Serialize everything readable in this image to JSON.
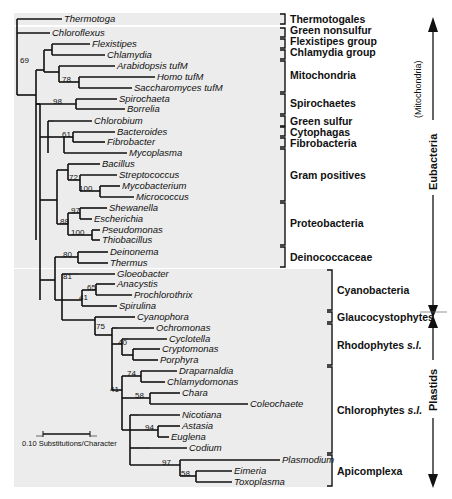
{
  "figure": {
    "type": "phylogenetic-tree",
    "scale_bar_label": "0.10 Substitutions/Character",
    "caption_partial": "",
    "taxa": [
      {
        "name": "Thermotoga",
        "y": 19,
        "x_end": 62
      },
      {
        "name": "Chloroflexus",
        "y": 33,
        "x_end": 50
      },
      {
        "name": "Flexistipes",
        "y": 44,
        "x_end": 90
      },
      {
        "name": "Chlamydia",
        "y": 55,
        "x_end": 105
      },
      {
        "name": "Arabidopsis tufM",
        "y": 66,
        "x_end": 115
      },
      {
        "name": "Homo tufM",
        "y": 77,
        "x_end": 155
      },
      {
        "name": "Saccharomyces tufM",
        "y": 88,
        "x_end": 132
      },
      {
        "name": "Spirochaeta",
        "y": 99,
        "x_end": 117
      },
      {
        "name": "Borrelia",
        "y": 109,
        "x_end": 125
      },
      {
        "name": "Chlorobium",
        "y": 121,
        "x_end": 92
      },
      {
        "name": "Bacteroides",
        "y": 132,
        "x_end": 115
      },
      {
        "name": "Fibrobacter",
        "y": 142,
        "x_end": 105
      },
      {
        "name": "Mycoplasma",
        "y": 153,
        "x_end": 127
      },
      {
        "name": "Bacillus",
        "y": 164,
        "x_end": 100
      },
      {
        "name": "Streptococcus",
        "y": 175,
        "x_end": 117
      },
      {
        "name": "Mycobacterium",
        "y": 186,
        "x_end": 120
      },
      {
        "name": "Micrococcus",
        "y": 197,
        "x_end": 134
      },
      {
        "name": "Shewanella",
        "y": 208,
        "x_end": 107
      },
      {
        "name": "Escherichia",
        "y": 219,
        "x_end": 92
      },
      {
        "name": "Pseudomonas",
        "y": 230,
        "x_end": 100
      },
      {
        "name": "Thiobacillus",
        "y": 240,
        "x_end": 100
      },
      {
        "name": "Deinonema",
        "y": 252,
        "x_end": 108
      },
      {
        "name": "Thermus",
        "y": 263,
        "x_end": 108
      },
      {
        "name": "Gloeobacter",
        "y": 274,
        "x_end": 115
      },
      {
        "name": "Anacystis",
        "y": 284,
        "x_end": 115
      },
      {
        "name": "Prochlorothrix",
        "y": 295,
        "x_end": 132
      },
      {
        "name": "Spirulina",
        "y": 306,
        "x_end": 117
      },
      {
        "name": "Cyanophora",
        "y": 317,
        "x_end": 135
      },
      {
        "name": "Ochromonas",
        "y": 328,
        "x_end": 154
      },
      {
        "name": "Cyclotella",
        "y": 339,
        "x_end": 167
      },
      {
        "name": "Cryptomonas",
        "y": 349,
        "x_end": 160
      },
      {
        "name": "Porphyra",
        "y": 360,
        "x_end": 158
      },
      {
        "name": "Draparnaldia",
        "y": 371,
        "x_end": 177
      },
      {
        "name": "Chlamydomonas",
        "y": 382,
        "x_end": 165
      },
      {
        "name": "Chara",
        "y": 393,
        "x_end": 180
      },
      {
        "name": "Coleochaete",
        "y": 404,
        "x_end": 248
      },
      {
        "name": "Nicotiana",
        "y": 415,
        "x_end": 180
      },
      {
        "name": "Astasia",
        "y": 426,
        "x_end": 180
      },
      {
        "name": "Euglena",
        "y": 437,
        "x_end": 169
      },
      {
        "name": "Codium",
        "y": 448,
        "x_end": 187
      },
      {
        "name": "Plasmodium",
        "y": 460,
        "x_end": 280
      },
      {
        "name": "Eimeria",
        "y": 471,
        "x_end": 232
      },
      {
        "name": "Toxoplasma",
        "y": 482,
        "x_end": 232
      }
    ],
    "bootstrap": [
      {
        "value": "69",
        "x": 20,
        "y": 63
      },
      {
        "value": "78",
        "x": 62,
        "y": 82
      },
      {
        "value": "98",
        "x": 53,
        "y": 104
      },
      {
        "value": "61",
        "x": 62,
        "y": 137
      },
      {
        "value": "72",
        "x": 69,
        "y": 180
      },
      {
        "value": "100",
        "x": 79,
        "y": 191
      },
      {
        "value": "97",
        "x": 71,
        "y": 213
      },
      {
        "value": "88",
        "x": 60,
        "y": 224
      },
      {
        "value": "100",
        "x": 71,
        "y": 235
      },
      {
        "value": "80",
        "x": 63,
        "y": 257
      },
      {
        "value": "81",
        "x": 63,
        "y": 279
      },
      {
        "value": "65",
        "x": 87,
        "y": 290
      },
      {
        "value": "41",
        "x": 79,
        "y": 300
      },
      {
        "value": "75",
        "x": 96,
        "y": 329
      },
      {
        "value": "40",
        "x": 118,
        "y": 345
      },
      {
        "value": "74",
        "x": 127,
        "y": 376
      },
      {
        "value": "41",
        "x": 110,
        "y": 392
      },
      {
        "value": "58",
        "x": 135,
        "y": 398
      },
      {
        "value": "94",
        "x": 145,
        "y": 430
      },
      {
        "value": "97",
        "x": 162,
        "y": 465
      },
      {
        "value": "58",
        "x": 181,
        "y": 476
      }
    ],
    "groups": [
      {
        "name": "Thermotogales",
        "y_top": 14,
        "y_bot": 24,
        "label_y": 23,
        "italic_suffix": ""
      },
      {
        "name": "Green nonsulfur",
        "y_top": 28,
        "y_bot": 37,
        "label_y": 34,
        "italic_suffix": ""
      },
      {
        "name": "Flexistipes group",
        "y_top": 39,
        "y_bot": 48,
        "label_y": 45,
        "italic_suffix": ""
      },
      {
        "name": "Chlamydia group",
        "y_top": 50,
        "y_bot": 59,
        "label_y": 56,
        "italic_suffix": ""
      },
      {
        "name": "Mitochondria",
        "y_top": 61,
        "y_bot": 92,
        "label_y": 79,
        "italic_suffix": ""
      },
      {
        "name": "Spirochaetes",
        "y_top": 94,
        "y_bot": 114,
        "label_y": 107,
        "italic_suffix": ""
      },
      {
        "name": "Green sulfur",
        "y_top": 116,
        "y_bot": 126,
        "label_y": 125,
        "italic_suffix": ""
      },
      {
        "name": "Cytophagas",
        "y_top": 127,
        "y_bot": 136,
        "label_y": 136,
        "italic_suffix": ""
      },
      {
        "name": "Fibrobacteria",
        "y_top": 138,
        "y_bot": 147,
        "label_y": 147,
        "italic_suffix": ""
      },
      {
        "name": "Gram positives",
        "y_top": 149,
        "y_bot": 201,
        "label_y": 179,
        "italic_suffix": ""
      },
      {
        "name": "Proteobacteria",
        "y_top": 203,
        "y_bot": 245,
        "label_y": 227,
        "italic_suffix": ""
      },
      {
        "name": "Deinococcaceae",
        "y_top": 247,
        "y_bot": 267,
        "label_y": 261,
        "italic_suffix": ""
      }
    ],
    "groups_lower": [
      {
        "name": "Cyanobacteria",
        "y_top": 270,
        "y_bot": 310,
        "label_y": 294,
        "italic_suffix": ""
      },
      {
        "name": "Glaucocystophytes",
        "y_top": 312,
        "y_bot": 322,
        "label_y": 321,
        "italic_suffix": ""
      },
      {
        "name": "Rhodophytes ",
        "y_top": 324,
        "y_bot": 365,
        "label_y": 349,
        "italic_suffix": "s.l."
      },
      {
        "name": "Chlorophytes ",
        "y_top": 367,
        "y_bot": 453,
        "label_y": 414,
        "italic_suffix": "s.l."
      },
      {
        "name": "Apicomplexa",
        "y_top": 455,
        "y_bot": 486,
        "label_y": 475,
        "italic_suffix": ""
      }
    ],
    "side_axes": {
      "mitochondria_label": "(Mitochondria)",
      "eubacteria_label": "Eubacteria",
      "plastids_label": "Plastids"
    }
  }
}
